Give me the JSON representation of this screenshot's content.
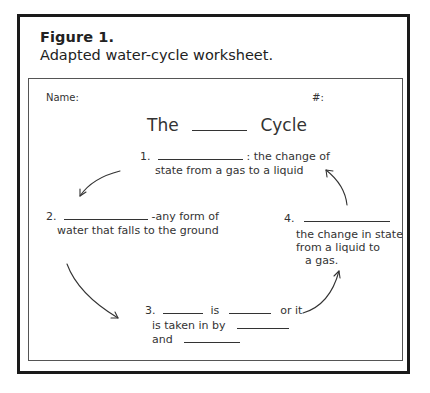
{
  "figure": {
    "label": "Figure 1.",
    "caption": "Adapted water-cycle worksheet."
  },
  "worksheet": {
    "name_label": "Name:",
    "number_label": "#:",
    "title_prefix": "The",
    "title_suffix": "Cycle",
    "steps": [
      {
        "number": "1.",
        "line1_after_blank": ": the change of",
        "line2": "state from a gas to a liquid"
      },
      {
        "number": "2.",
        "line1_after_blank": "-any form of",
        "line2": "water that falls to the ground"
      },
      {
        "number": "3.",
        "word_is": "is",
        "word_orit": "or it",
        "line2": "is taken in by",
        "line3": "and"
      },
      {
        "number": "4.",
        "line2": "the change in state",
        "line3": "from a liquid to",
        "line4": "a gas."
      }
    ],
    "arrows": [
      "step1-to-step2",
      "step2-to-step3",
      "step3-to-step4",
      "step4-to-step1"
    ]
  }
}
